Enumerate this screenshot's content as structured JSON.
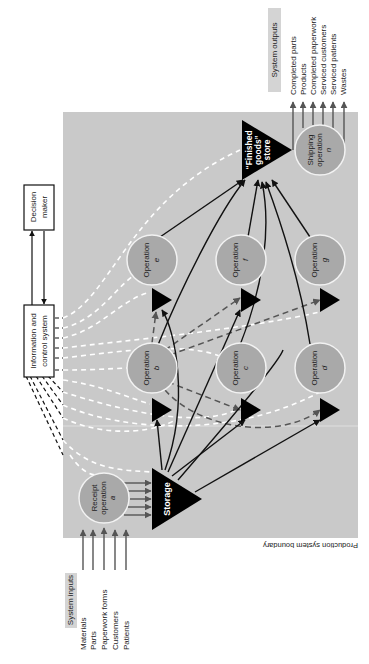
{
  "diagram": {
    "boundary_label": "Production system boundary",
    "inputs": {
      "title": "System inputs",
      "items": [
        "Materials",
        "Parts",
        "Paperwork forms",
        "Customers",
        "Patients"
      ]
    },
    "outputs": {
      "title": "System outputs",
      "items": [
        "Completed parts",
        "Products",
        "Completed paperwork",
        "Serviced customers",
        "Serviced patients",
        "Wastes"
      ]
    },
    "info_system": {
      "line1": "Information and",
      "line2": "control system"
    },
    "decision_maker": {
      "line1": "Decision",
      "line2": "maker"
    },
    "receipt": {
      "line1": "Receipt",
      "line2": "operation",
      "letter": "a"
    },
    "storage": {
      "label": "Storage"
    },
    "finished_goods": {
      "line1": "“Finished",
      "line2": "goods”",
      "line3": "store"
    },
    "shipping": {
      "line1": "Shipping",
      "line2": "operation",
      "letter": "n"
    },
    "operations": [
      {
        "label": "Operation",
        "letter": "b"
      },
      {
        "label": "Operation",
        "letter": "c"
      },
      {
        "label": "Operation",
        "letter": "d"
      },
      {
        "label": "Operation",
        "letter": "e"
      },
      {
        "label": "Operation",
        "letter": "f"
      },
      {
        "label": "Operation",
        "letter": "g"
      }
    ],
    "colors": {
      "boundary_fill": "#c9c9c9",
      "node_fill": "#a9a9a9",
      "node_stroke": "#f2f2f2",
      "store_fill": "#000000",
      "info_flow": "#ffffff",
      "material_flow": "#111111",
      "secondary_flow": "#555555"
    }
  }
}
